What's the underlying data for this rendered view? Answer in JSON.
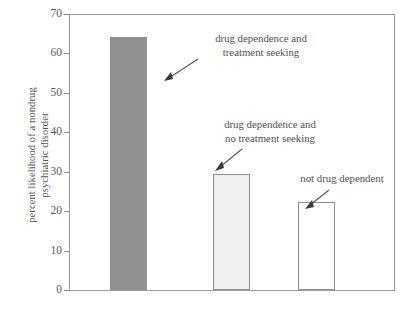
{
  "chart_data": {
    "type": "bar",
    "title": "",
    "xlabel": "",
    "ylabel": "percent likelihood of a nondrug psychiatric disorder",
    "ylabel_lines": [
      "percent likelihood of a nondrug",
      "psychiatric disorder"
    ],
    "categories": [
      "drug dependence and treatment seeking",
      "drug dependence and no treatment seeking",
      "not drug dependent"
    ],
    "values": [
      64.5,
      29.5,
      22.3
    ],
    "ylim": [
      0,
      70
    ],
    "yticks": [
      0,
      10,
      20,
      30,
      40,
      50,
      60,
      70
    ],
    "ytick_labels": [
      "0",
      "10",
      "20",
      "30",
      "40",
      "50",
      "60",
      "70"
    ],
    "grid": false,
    "legend": "none",
    "bar_colors": [
      "#909090",
      "#f0f0f0",
      "#ffffff"
    ],
    "bar_edge_color": "#8d8d8d",
    "annotations": [
      {
        "lines": [
          "drug dependence and",
          "treatment seeking"
        ],
        "target_bar": 0
      },
      {
        "lines": [
          "drug dependence and",
          "no treatment seeking"
        ],
        "target_bar": 1
      },
      {
        "lines": [
          "not drug dependent"
        ],
        "target_bar": 2
      }
    ]
  }
}
